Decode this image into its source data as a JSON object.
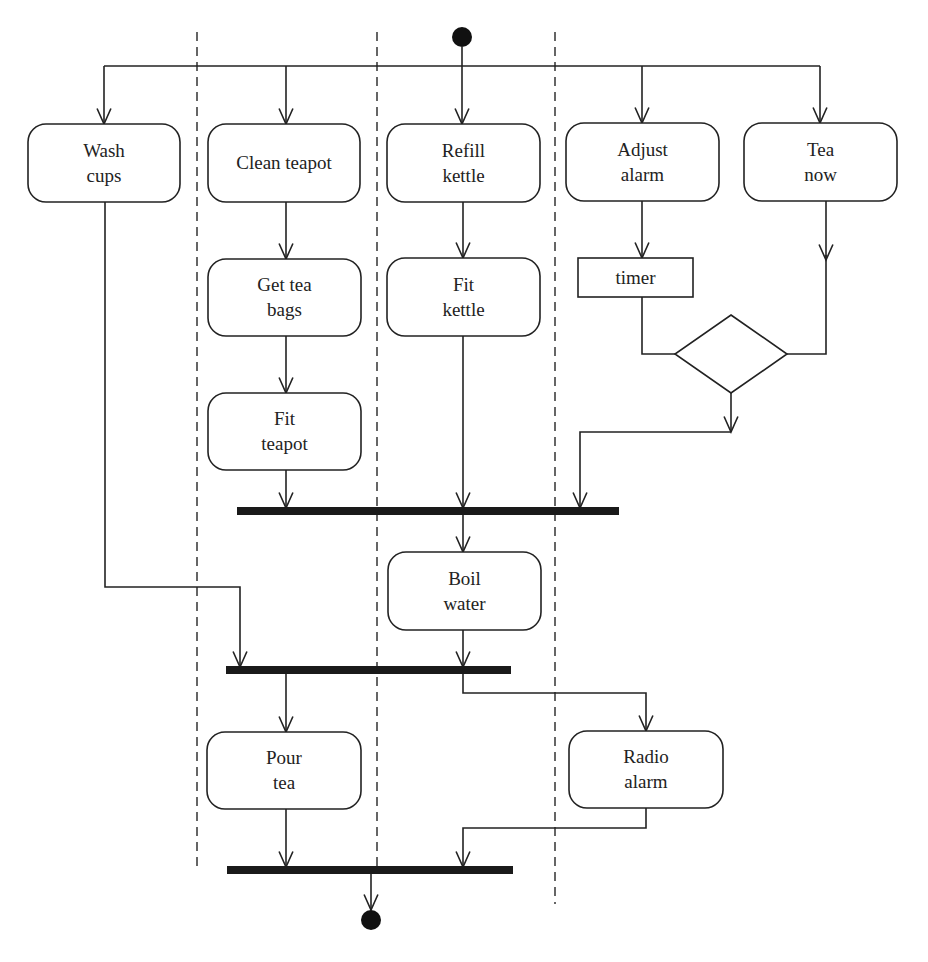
{
  "diagram": {
    "type": "uml-activity-diagram",
    "colors": {
      "stroke": "#222222",
      "background": "#ffffff",
      "bar": "#1a1a1a"
    },
    "start_node": {
      "x": 462,
      "y": 37,
      "r": 10
    },
    "end_node": {
      "x": 371,
      "y": 920,
      "r": 10
    },
    "swimlane_dividers": [
      {
        "x": 197,
        "y1": 32,
        "y2": 866
      },
      {
        "x": 377,
        "y1": 32,
        "y2": 866
      },
      {
        "x": 555,
        "y1": 32,
        "y2": 904
      }
    ],
    "activities": [
      {
        "id": "wash_cups",
        "lines": [
          "Wash",
          "cups"
        ],
        "x": 28,
        "y": 124,
        "w": 152,
        "h": 78
      },
      {
        "id": "clean_teapot",
        "lines": [
          "Clean teapot"
        ],
        "x": 208,
        "y": 124,
        "w": 152,
        "h": 78
      },
      {
        "id": "refill_kettle",
        "lines": [
          "Refill",
          "kettle"
        ],
        "x": 387,
        "y": 124,
        "w": 153,
        "h": 78
      },
      {
        "id": "adjust_alarm",
        "lines": [
          "Adjust",
          "alarm"
        ],
        "x": 566,
        "y": 123,
        "w": 153,
        "h": 78
      },
      {
        "id": "tea_now",
        "lines": [
          "Tea",
          "now"
        ],
        "x": 744,
        "y": 123,
        "w": 153,
        "h": 78
      },
      {
        "id": "get_tea_bags",
        "lines": [
          "Get tea",
          "bags"
        ],
        "x": 208,
        "y": 259,
        "w": 153,
        "h": 77
      },
      {
        "id": "fit_kettle",
        "lines": [
          "Fit",
          "kettle"
        ],
        "x": 387,
        "y": 258,
        "w": 153,
        "h": 78
      },
      {
        "id": "fit_teapot",
        "lines": [
          "Fit",
          "teapot"
        ],
        "x": 208,
        "y": 393,
        "w": 153,
        "h": 77
      },
      {
        "id": "boil_water",
        "lines": [
          "Boil",
          "water"
        ],
        "x": 388,
        "y": 552,
        "w": 153,
        "h": 78
      },
      {
        "id": "pour_tea",
        "lines": [
          "Pour",
          "tea"
        ],
        "x": 207,
        "y": 732,
        "w": 154,
        "h": 77
      },
      {
        "id": "radio_alarm",
        "lines": [
          "Radio",
          "alarm"
        ],
        "x": 569,
        "y": 731,
        "w": 154,
        "h": 77
      }
    ],
    "objects": [
      {
        "id": "timer",
        "label": "timer",
        "x": 578,
        "y": 258,
        "w": 115,
        "h": 39
      }
    ],
    "decision": {
      "id": "decision",
      "cx": 731,
      "cy": 354,
      "hw": 56,
      "hh": 39
    },
    "bars": [
      {
        "id": "join_1",
        "x1": 237,
        "x2": 619,
        "y": 511
      },
      {
        "id": "join_2",
        "x1": 226,
        "x2": 511,
        "y": 670
      },
      {
        "id": "join_3",
        "x1": 227,
        "x2": 513,
        "y": 870
      }
    ],
    "edges": [
      {
        "points": [
          [
            462,
            47
          ],
          [
            462,
            124
          ]
        ],
        "arrow": true
      },
      {
        "points": [
          [
            104,
            66
          ],
          [
            820,
            66
          ]
        ],
        "arrow": false
      },
      {
        "points": [
          [
            104,
            66
          ],
          [
            104,
            124
          ]
        ],
        "arrow": true
      },
      {
        "points": [
          [
            286,
            66
          ],
          [
            286,
            124
          ]
        ],
        "arrow": true
      },
      {
        "points": [
          [
            642,
            66
          ],
          [
            642,
            123
          ]
        ],
        "arrow": true
      },
      {
        "points": [
          [
            820,
            66
          ],
          [
            820,
            123
          ]
        ],
        "arrow": true
      },
      {
        "points": [
          [
            286,
            202
          ],
          [
            286,
            259
          ]
        ],
        "arrow": true
      },
      {
        "points": [
          [
            286,
            336
          ],
          [
            286,
            393
          ]
        ],
        "arrow": true
      },
      {
        "points": [
          [
            286,
            470
          ],
          [
            286,
            508
          ]
        ],
        "arrow": true
      },
      {
        "points": [
          [
            463,
            202
          ],
          [
            463,
            258
          ]
        ],
        "arrow": true
      },
      {
        "points": [
          [
            463,
            336
          ],
          [
            463,
            508
          ]
        ],
        "arrow": true
      },
      {
        "points": [
          [
            642,
            201
          ],
          [
            642,
            258
          ]
        ],
        "arrow": true
      },
      {
        "points": [
          [
            642,
            297
          ],
          [
            642,
            354
          ],
          [
            675,
            354
          ]
        ],
        "arrow": false
      },
      {
        "points": [
          [
            826,
            201
          ],
          [
            826,
            260
          ]
        ],
        "arrow": true
      },
      {
        "points": [
          [
            826,
            255
          ],
          [
            826,
            354
          ],
          [
            787,
            354
          ]
        ],
        "arrow": false
      },
      {
        "points": [
          [
            731,
            393
          ],
          [
            731,
            432
          ]
        ],
        "arrow": true
      },
      {
        "points": [
          [
            731,
            432
          ],
          [
            580,
            432
          ],
          [
            580,
            508
          ]
        ],
        "arrow": true
      },
      {
        "points": [
          [
            463,
            513
          ],
          [
            463,
            552
          ]
        ],
        "arrow": true
      },
      {
        "points": [
          [
            105,
            202
          ],
          [
            105,
            587
          ],
          [
            240,
            587
          ],
          [
            240,
            667
          ]
        ],
        "arrow": true
      },
      {
        "points": [
          [
            463,
            630
          ],
          [
            463,
            667
          ]
        ],
        "arrow": true
      },
      {
        "points": [
          [
            286,
            672
          ],
          [
            286,
            732
          ]
        ],
        "arrow": true
      },
      {
        "points": [
          [
            463,
            672
          ],
          [
            463,
            693
          ],
          [
            646,
            693
          ],
          [
            646,
            731
          ]
        ],
        "arrow": true
      },
      {
        "points": [
          [
            286,
            809
          ],
          [
            286,
            867
          ]
        ],
        "arrow": true
      },
      {
        "points": [
          [
            646,
            808
          ],
          [
            646,
            828
          ],
          [
            463,
            828
          ],
          [
            463,
            867
          ]
        ],
        "arrow": true
      },
      {
        "points": [
          [
            371,
            872
          ],
          [
            371,
            910
          ]
        ],
        "arrow": true
      }
    ]
  }
}
